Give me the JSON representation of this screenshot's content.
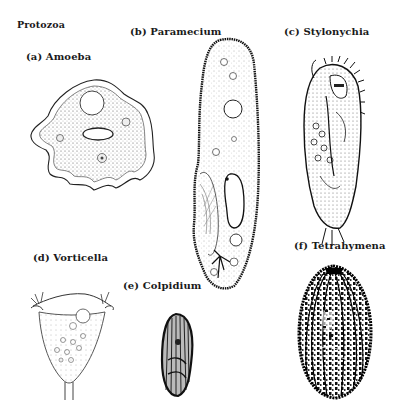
{
  "figure": {
    "title": "Protozoa",
    "organisms": [
      {
        "id": "a",
        "label": "(a) Amoeba"
      },
      {
        "id": "b",
        "label": "(b) Paramecium"
      },
      {
        "id": "c",
        "label": "(c) Stylonychia"
      },
      {
        "id": "d",
        "label": "(d) Vorticella"
      },
      {
        "id": "e",
        "label": "(e) Colpidium"
      },
      {
        "id": "f",
        "label": "(f) Tetrahymena"
      }
    ],
    "colors": {
      "background": "#ffffff",
      "ink": "#1a1a1a"
    }
  }
}
